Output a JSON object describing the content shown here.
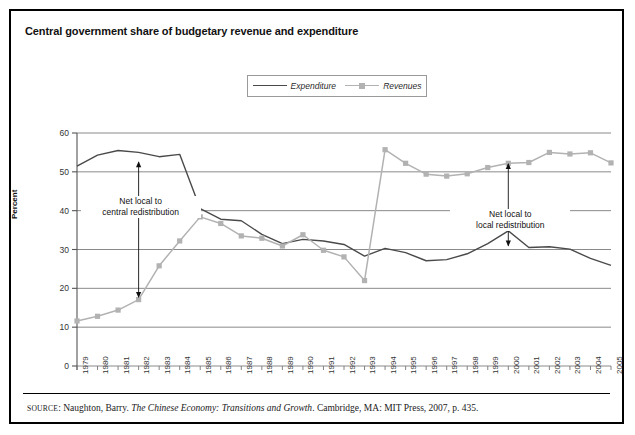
{
  "figure": {
    "title": "Central government share of budgetary revenue and expenditure",
    "source_prefix": "SOURCE",
    "source_author": ": Naughton, Barry. ",
    "source_work": "The Chinese Economy: Transitions and Growth",
    "source_rest": ". Cambridge, MA: MIT Press, 2007, p. 435."
  },
  "legend": {
    "expenditure_label": "Expenditure",
    "revenues_label": "Revenues",
    "expenditure_color": "#4a4a4a",
    "revenues_color": "#b2b2b2"
  },
  "annotations": {
    "left_line1": "Net local to",
    "left_line2": "central redistribution",
    "right_line1": "Net local to",
    "right_line2": "local redistribution"
  },
  "chart_data": {
    "type": "line",
    "title": "Central government share of budgetary revenue and expenditure",
    "xlabel": "",
    "ylabel": "Percent",
    "ylim": [
      0,
      60
    ],
    "yticks": [
      0,
      10,
      20,
      30,
      40,
      50,
      60
    ],
    "grid": true,
    "legend_position": "top-center",
    "categories": [
      "1979",
      "1980",
      "1981",
      "1982",
      "1983",
      "1984",
      "1985",
      "1986",
      "1987",
      "1988",
      "1989",
      "1990",
      "1991",
      "1992",
      "1993",
      "1994",
      "1995",
      "1996",
      "1997",
      "1998",
      "1999",
      "2000",
      "2001",
      "2002",
      "2003",
      "2004",
      "2005"
    ],
    "series": [
      {
        "name": "Expenditure",
        "color": "#4a4a4a",
        "marker": "none",
        "values": [
          51.5,
          54.3,
          55.5,
          55.0,
          53.9,
          54.5,
          40.5,
          37.8,
          37.4,
          33.9,
          31.5,
          32.6,
          32.2,
          31.3,
          28.3,
          30.3,
          29.2,
          27.1,
          27.4,
          28.9,
          31.5,
          34.8,
          30.5,
          30.7,
          30.1,
          27.7,
          25.9
        ]
      },
      {
        "name": "Revenues",
        "color": "#b2b2b2",
        "marker": "square",
        "values": [
          11.6,
          12.8,
          14.4,
          17.1,
          25.8,
          32.2,
          38.4,
          36.7,
          33.5,
          32.9,
          30.9,
          33.8,
          29.8,
          28.1,
          22.0,
          55.7,
          52.2,
          49.4,
          48.9,
          49.5,
          51.1,
          52.2,
          52.4,
          55.0,
          54.6,
          54.9,
          52.3
        ]
      }
    ]
  }
}
